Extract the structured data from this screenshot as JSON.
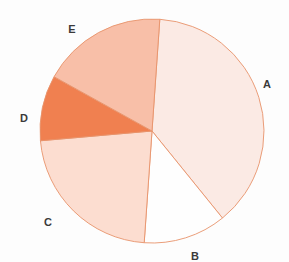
{
  "chart_data": {
    "type": "pie",
    "title": "",
    "categories": [
      "A",
      "B",
      "C",
      "D",
      "E"
    ],
    "values": [
      38.1,
      11.9,
      22.5,
      9.4,
      18.1
    ],
    "labels": [
      "A",
      "B",
      "C",
      "D",
      "E"
    ],
    "colors": [
      "#FBEAE4",
      "#FEFEFE",
      "#FCDDD0",
      "#F08050",
      "#F8BFA8"
    ],
    "edge_color": "#E8936B",
    "start_angle_deg": 94,
    "direction": "clockwise",
    "legend": "none",
    "grid": false,
    "xlabel": "",
    "ylabel": "",
    "label_positions": [
      {
        "label": "A",
        "x": 267,
        "y": 84
      },
      {
        "label": "B",
        "x": 195,
        "y": 256
      },
      {
        "label": "C",
        "x": 48,
        "y": 222
      },
      {
        "label": "D",
        "x": 24,
        "y": 118
      },
      {
        "label": "E",
        "x": 72,
        "y": 29
      }
    ],
    "geometry": {
      "center_x": 152,
      "center_y": 131,
      "radius": 112
    },
    "slice_angles_deg": [
      {
        "label": "A",
        "start": 4,
        "end": 141
      },
      {
        "label": "B",
        "start": 141,
        "end": 184
      },
      {
        "label": "C",
        "start": 184,
        "end": 265
      },
      {
        "label": "D",
        "start": 265,
        "end": 299
      },
      {
        "label": "E",
        "start": 299,
        "end": 364
      }
    ]
  },
  "figure": {
    "background": "#fdfdfd"
  }
}
